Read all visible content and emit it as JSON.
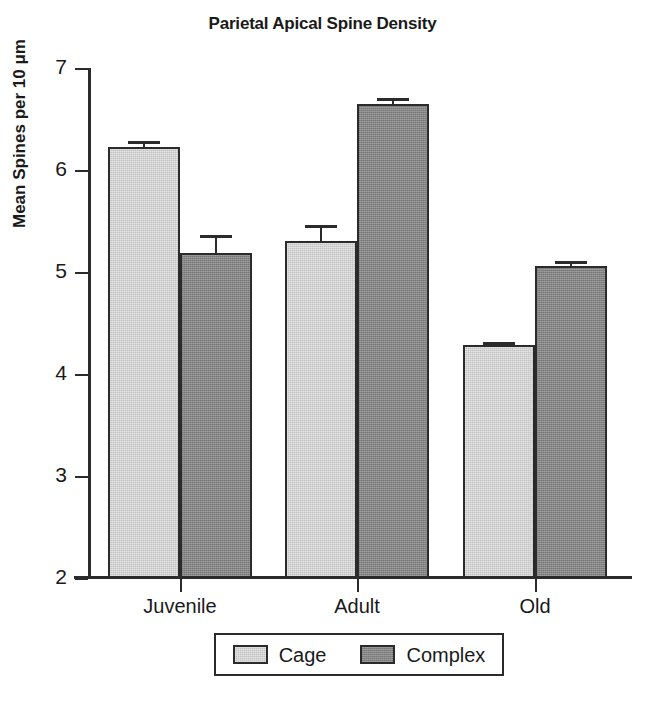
{
  "chart_data": {
    "type": "bar",
    "title": "Parietal Apical Spine Density",
    "xlabel": "",
    "ylabel": "Mean Spines per 10 μm",
    "categories": [
      "Juvenile",
      "Adult",
      "Old"
    ],
    "ylim": [
      2,
      7
    ],
    "yticks": [
      2,
      3,
      4,
      5,
      6,
      7
    ],
    "ytick_labels": [
      "2",
      "3",
      "4",
      "5",
      "6",
      "7"
    ],
    "grid": false,
    "legend_position": "bottom",
    "series": [
      {
        "name": "Cage",
        "color": "#c2c2c2",
        "values": [
          6.23,
          5.3,
          4.28
        ],
        "errors": [
          0.05,
          0.16,
          0.03
        ]
      },
      {
        "name": "Complex",
        "color": "#848484",
        "values": [
          5.19,
          6.65,
          5.06
        ],
        "errors": [
          0.17,
          0.06,
          0.05
        ]
      }
    ]
  }
}
